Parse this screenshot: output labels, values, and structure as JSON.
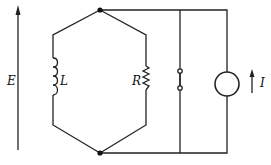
{
  "labels": {
    "E": "E",
    "L": "L",
    "R": "R",
    "I": "I"
  },
  "colors": {
    "line": "#222222",
    "background": "#ffffff"
  }
}
